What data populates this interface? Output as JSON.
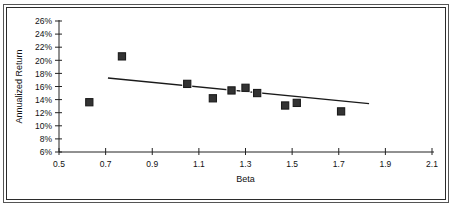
{
  "chart_data": {
    "type": "scatter",
    "title": "",
    "xlabel": "Beta",
    "ylabel": "Annualized Return",
    "xlim": [
      0.5,
      2.1
    ],
    "ylim": [
      6,
      26
    ],
    "xticks": [
      "0.5",
      "0.7",
      "0.9",
      "1.1",
      "1.3",
      "1.5",
      "1.7",
      "1.9",
      "2.1"
    ],
    "yticks": [
      "6%",
      "8%",
      "10%",
      "12%",
      "14%",
      "16%",
      "18%",
      "20%",
      "22%",
      "24%",
      "26%"
    ],
    "grid": false,
    "legend": "none",
    "marker": "filled-square",
    "marker_color": "#333333",
    "points": [
      {
        "x": 0.63,
        "y": 13.6
      },
      {
        "x": 0.77,
        "y": 20.6
      },
      {
        "x": 1.05,
        "y": 16.4
      },
      {
        "x": 1.16,
        "y": 14.2
      },
      {
        "x": 1.24,
        "y": 15.4
      },
      {
        "x": 1.3,
        "y": 15.8
      },
      {
        "x": 1.35,
        "y": 15.0
      },
      {
        "x": 1.47,
        "y": 13.1
      },
      {
        "x": 1.52,
        "y": 13.5
      },
      {
        "x": 1.71,
        "y": 12.2
      }
    ],
    "trendline": {
      "type": "linear",
      "x_start": 0.71,
      "y_start": 17.3,
      "x_end": 1.83,
      "y_end": 13.4,
      "color": "#1a1a1a"
    }
  },
  "axes": {
    "x_axis_name": "beta-axis",
    "y_axis_name": "annualized-return-axis"
  }
}
